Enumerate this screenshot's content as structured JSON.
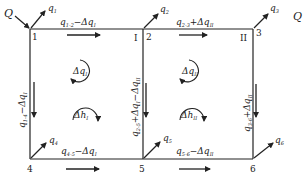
{
  "diagram": {
    "type": "pipe-network-loop-correction",
    "colors": {
      "line": "#222222",
      "background": "#ffffff"
    },
    "source": {
      "label": "Q",
      "label_right": "Q"
    },
    "nodes": [
      {
        "id": "1",
        "label": "1"
      },
      {
        "id": "2",
        "label": "2"
      },
      {
        "id": "3",
        "label": "3"
      },
      {
        "id": "4",
        "label": "4"
      },
      {
        "id": "5",
        "label": "5"
      },
      {
        "id": "6",
        "label": "6"
      }
    ],
    "loops": [
      {
        "id": "I",
        "label": "I",
        "dq": "Δq",
        "dq_sub": "I",
        "dh": "Δh",
        "dh_sub": "I"
      },
      {
        "id": "II",
        "label": "II",
        "dq": "Δq",
        "dq_sub": "II",
        "dh": "Δh",
        "dh_sub": "II"
      }
    ],
    "outflows": [
      {
        "node": "1",
        "q": "q",
        "sub": "1"
      },
      {
        "node": "2",
        "q": "q",
        "sub": "2"
      },
      {
        "node": "3",
        "q": "q",
        "sub": "3"
      },
      {
        "node": "4",
        "q": "q",
        "sub": "4"
      },
      {
        "node": "5",
        "q": "q",
        "sub": "5"
      },
      {
        "node": "6",
        "q": "q",
        "sub": "6"
      }
    ],
    "pipes": [
      {
        "id": "1-2",
        "q": "q",
        "sub": "1-2",
        "corr": "−Δq",
        "corr_sub": "I"
      },
      {
        "id": "2-3",
        "q": "q",
        "sub": "2-3",
        "corr": "+Δq",
        "corr_sub": "II"
      },
      {
        "id": "1-4",
        "q": "q",
        "sub": "1-4",
        "corr": "−Δq",
        "corr_sub": "I"
      },
      {
        "id": "2-5",
        "q": "q",
        "sub": "2-5",
        "corr": "+Δq",
        "corr_sub": "I",
        "corr2": "−Δq",
        "corr2_sub": "II"
      },
      {
        "id": "3-6",
        "q": "q",
        "sub": "3-6",
        "corr": "+Δq",
        "corr_sub": "II"
      },
      {
        "id": "4-5",
        "q": "q",
        "sub": "4-5",
        "corr": "−Δq",
        "corr_sub": "I"
      },
      {
        "id": "5-6",
        "q": "q",
        "sub": "5-6",
        "corr": "−Δq",
        "corr_sub": "II"
      }
    ]
  }
}
